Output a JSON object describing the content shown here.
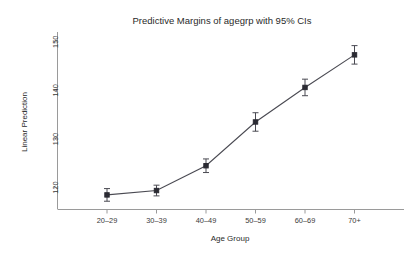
{
  "chart_data": {
    "type": "line",
    "title": "Predictive Margins of agegrp with 95% CIs",
    "xlabel": "Age Group",
    "ylabel": "Linear Prediction",
    "categories": [
      "20–29",
      "30–39",
      "40–49",
      "50–59",
      "60–69",
      "70+"
    ],
    "values": [
      118.5,
      119.4,
      124.5,
      133.5,
      140.6,
      147.3
    ],
    "ci_lower": [
      117.2,
      118.3,
      123.1,
      131.6,
      138.9,
      145.4
    ],
    "ci_upper": [
      119.8,
      120.5,
      125.9,
      135.4,
      142.3,
      149.2
    ],
    "series": [
      {
        "name": "Linear Prediction",
        "values": [
          118.5,
          119.4,
          124.5,
          133.5,
          140.6,
          147.3
        ]
      }
    ],
    "ytick_labels": [
      "120",
      "130",
      "140",
      "150"
    ],
    "ytick_values": [
      120,
      130,
      140,
      150
    ],
    "ylim": [
      115.5,
      152.0
    ],
    "xlim": [
      0,
      7
    ],
    "grid": false,
    "legend": "none",
    "marker": "filled-square",
    "error_bar_style": "capped-whisker",
    "line_color": "#4a4a52",
    "marker_color": "#2b2b33",
    "axis_color": "#9a9a9a",
    "background_color": "#ffffff"
  }
}
